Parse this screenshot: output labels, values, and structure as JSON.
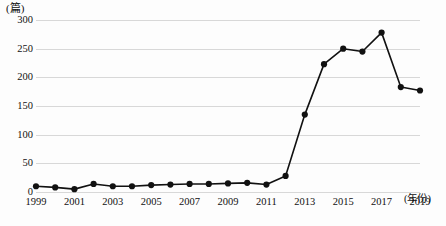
{
  "chart_data": {
    "type": "line",
    "title": "",
    "subtitle": "",
    "xlabel": "(年份)",
    "ylabel": "(篇)",
    "categories": [
      "1999",
      "2000",
      "2001",
      "2002",
      "2003",
      "2004",
      "2005",
      "2006",
      "2007",
      "2008",
      "2009",
      "2010",
      "2011",
      "2012",
      "2013",
      "2014",
      "2015",
      "2016",
      "2017",
      "2018",
      "2019"
    ],
    "values": [
      10,
      8,
      5,
      14,
      10,
      10,
      12,
      13,
      14,
      14,
      15,
      16,
      13,
      28,
      135,
      223,
      250,
      245,
      278,
      183,
      177
    ],
    "xlim": [
      "1999",
      "2019"
    ],
    "ylim": [
      0,
      300
    ],
    "y_ticks": [
      0,
      50,
      100,
      150,
      200,
      250,
      300
    ],
    "y_tick_labels": [
      "0",
      "50",
      "100",
      "150",
      "200",
      "250",
      "300"
    ],
    "x_tick_labels": [
      "1999",
      "2001",
      "2003",
      "2005",
      "2007",
      "2009",
      "2011",
      "2013",
      "2015",
      "2017",
      "2019"
    ],
    "x_tick_values": [
      "1999",
      "2001",
      "2003",
      "2005",
      "2007",
      "2009",
      "2011",
      "2013",
      "2015",
      "2017",
      "2019"
    ],
    "grid": true,
    "grid_axis": "y",
    "legend": false,
    "legend_position": "none",
    "series": [
      {
        "name": "论文数量",
        "values": [
          10,
          8,
          5,
          14,
          10,
          10,
          12,
          13,
          14,
          14,
          15,
          16,
          13,
          28,
          135,
          223,
          250,
          245,
          278,
          183,
          177
        ],
        "line_color": "#111111",
        "marker": "circle",
        "marker_color": "#111111",
        "marker_size": 5
      }
    ],
    "colors": {
      "line": "#111111",
      "marker": "#111111",
      "grid": "#d8d8d8",
      "text": "#111111",
      "background": "#fdfdfd"
    }
  }
}
